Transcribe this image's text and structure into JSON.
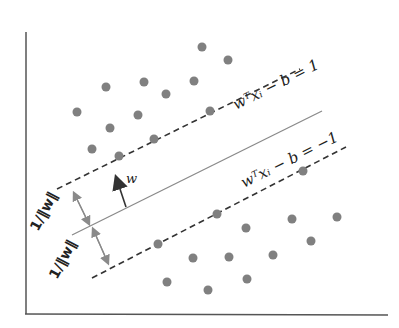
{
  "diagram": {
    "title": "",
    "type": "svm-max-margin-hyperplane",
    "colors": {
      "axis": "#555555",
      "point": "#808080",
      "hyperplane": "#8a8a8a",
      "margin": "#333333",
      "text": "#222222",
      "annotation_arrow": "#8a8a8a",
      "normal_arrow": "#333333"
    },
    "labels": {
      "upper_margin": "wᵀxᵢ − b = 1",
      "lower_margin": "wᵀxᵢ − b = −1",
      "normal_vector": "w",
      "upper_distance": "1/‖w‖",
      "lower_distance": "1/‖w‖"
    },
    "upper_class_points": [
      [
        202,
        47
      ],
      [
        228,
        60
      ],
      [
        106,
        87
      ],
      [
        144,
        82
      ],
      [
        194,
        81
      ],
      [
        166,
        94
      ],
      [
        77,
        112
      ],
      [
        138,
        115
      ],
      [
        110,
        128
      ],
      [
        92,
        149
      ],
      [
        119,
        156
      ],
      [
        154,
        139
      ],
      [
        210,
        111
      ]
    ],
    "lower_class_points": [
      [
        303,
        171
      ],
      [
        158,
        244
      ],
      [
        217,
        214
      ],
      [
        246,
        228
      ],
      [
        292,
        219
      ],
      [
        337,
        217
      ],
      [
        311,
        241
      ],
      [
        193,
        258
      ],
      [
        229,
        257
      ],
      [
        273,
        255
      ],
      [
        167,
        282
      ],
      [
        208,
        290
      ],
      [
        247,
        279
      ]
    ]
  }
}
